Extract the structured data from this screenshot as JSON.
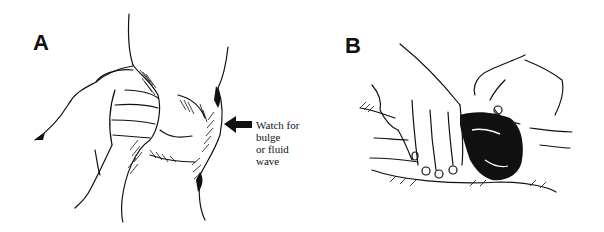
{
  "figure": {
    "panels": [
      {
        "id": "A",
        "label": "A",
        "description": "Hand compressing suprapatellar pouch of knee",
        "annotation": {
          "lines": [
            "Watch for bulge",
            "or fluid wave"
          ],
          "arrow_direction": "left"
        }
      },
      {
        "id": "B",
        "label": "B",
        "description": "Two hands palpating knee joint from above"
      }
    ],
    "colors": {
      "ink": "#111111",
      "background": "#ffffff"
    }
  }
}
